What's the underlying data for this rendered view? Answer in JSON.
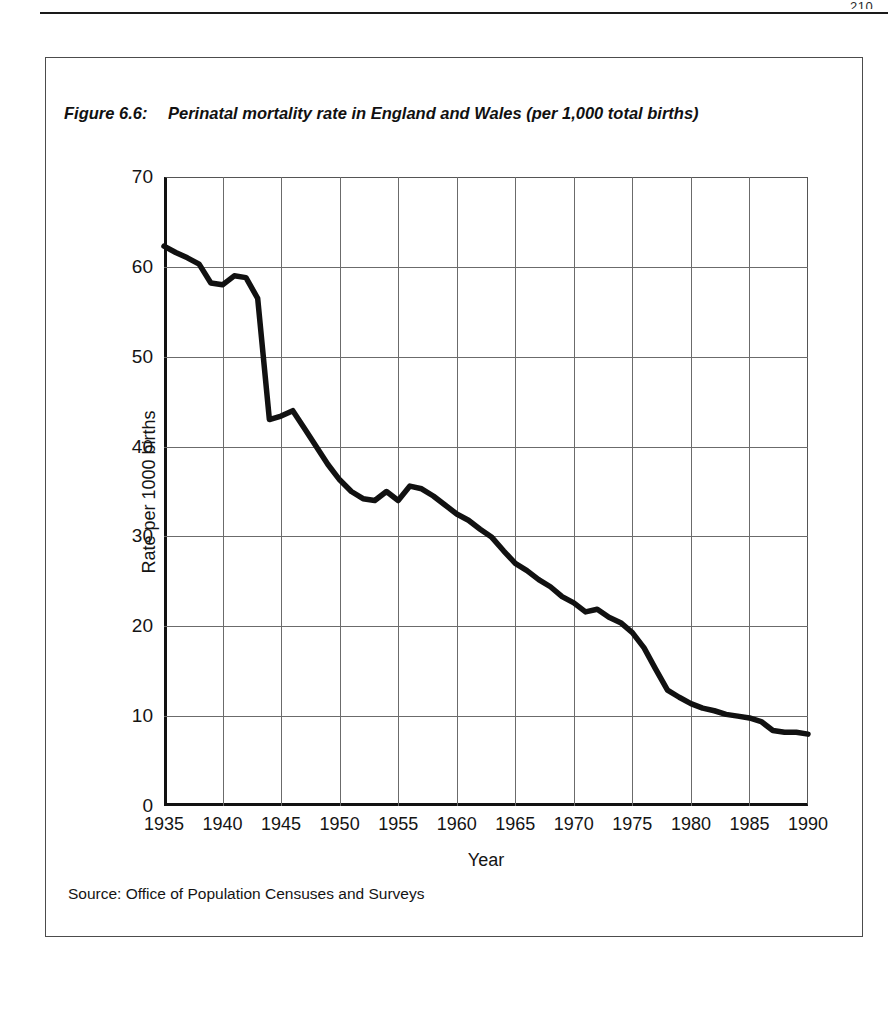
{
  "page": {
    "number_sliver": "210",
    "rule": "page-header-rule"
  },
  "figure": {
    "label": "Figure 6.6:",
    "caption": "Perinatal mortality rate in England and Wales (per 1,000 total births)",
    "source": "Source: Office of Population Censuses and Surveys"
  },
  "colors": {
    "series_line": "#111111",
    "grid": "#6b6b6b",
    "axis": "#111111",
    "frame": "#4c4c4c",
    "text": "#141414",
    "background": "#ffffff"
  },
  "chart_data": {
    "type": "line",
    "title": "Perinatal mortality rate in England and Wales (per 1,000 total births)",
    "xlabel": "Year",
    "ylabel": "Rate per 1000 births",
    "xlim": [
      1935,
      1990
    ],
    "ylim": [
      0,
      70
    ],
    "ytick_labels": [
      "0",
      "10",
      "20",
      "30",
      "40",
      "50",
      "60",
      "70"
    ],
    "yticks": [
      0,
      10,
      20,
      30,
      40,
      50,
      60,
      70
    ],
    "xtick_labels": [
      "1935",
      "1940",
      "1945",
      "1950",
      "1955",
      "1960",
      "1965",
      "1970",
      "1975",
      "1980",
      "1985",
      "1990"
    ],
    "xticks": [
      1935,
      1940,
      1945,
      1950,
      1955,
      1960,
      1965,
      1970,
      1975,
      1980,
      1985,
      1990
    ],
    "grid": true,
    "legend": null,
    "series": [
      {
        "name": "Perinatal mortality rate",
        "x": [
          1935,
          1936,
          1937,
          1938,
          1939,
          1940,
          1941,
          1942,
          1943,
          1944,
          1945,
          1946,
          1947,
          1948,
          1949,
          1950,
          1951,
          1952,
          1953,
          1954,
          1955,
          1956,
          1957,
          1958,
          1959,
          1960,
          1961,
          1962,
          1963,
          1964,
          1965,
          1966,
          1967,
          1968,
          1969,
          1970,
          1971,
          1972,
          1973,
          1974,
          1975,
          1976,
          1977,
          1978,
          1979,
          1980,
          1981,
          1982,
          1983,
          1984,
          1985,
          1986,
          1987,
          1988,
          1989,
          1990
        ],
        "y": [
          62.3,
          61.6,
          61.0,
          60.3,
          58.2,
          58.0,
          59.0,
          58.8,
          56.5,
          43.0,
          43.4,
          44.0,
          42.0,
          40.0,
          38.0,
          36.3,
          35.0,
          34.2,
          34.0,
          35.0,
          34.0,
          35.6,
          35.3,
          34.5,
          33.5,
          32.5,
          31.8,
          30.8,
          29.9,
          28.4,
          27.0,
          26.2,
          25.2,
          24.4,
          23.3,
          22.6,
          21.6,
          21.9,
          21.0,
          20.4,
          19.3,
          17.6,
          15.2,
          12.9,
          12.1,
          11.4,
          10.9,
          10.6,
          10.2,
          10.0,
          9.8,
          9.4,
          8.4,
          8.2,
          8.2,
          8.0
        ]
      }
    ]
  }
}
